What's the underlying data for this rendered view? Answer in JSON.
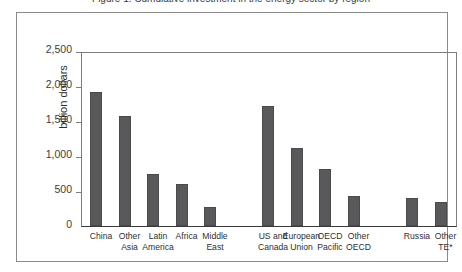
{
  "caption": {
    "text": "Figure 1. Cumulative investment in the energy sector by region"
  },
  "chart_data": {
    "type": "bar",
    "title": "",
    "xlabel": "",
    "ylabel": "billion dollars",
    "ylim": [
      0,
      2500
    ],
    "grid": false,
    "legend": "none",
    "y_ticks": [
      "0",
      "500",
      "1,000",
      "1,500",
      "2,000",
      "2,500"
    ],
    "y_tick_values": [
      0,
      500,
      1000,
      1500,
      2000,
      2500
    ],
    "categories": [
      "China",
      "Other Asia",
      "Latin America",
      "Africa",
      "Middle East",
      "US and Canada",
      "European Union",
      "OECD Pacific",
      "Other OECD",
      "Russia",
      "Other TE*"
    ],
    "category_lines": [
      [
        "China"
      ],
      [
        "Other",
        "Asia"
      ],
      [
        "Latin",
        "America"
      ],
      [
        "Africa"
      ],
      [
        "Middle",
        "East"
      ],
      [
        "US and",
        "Canada"
      ],
      [
        "European",
        "Union"
      ],
      [
        "OECD",
        "Pacific"
      ],
      [
        "Other",
        "OECD"
      ],
      [
        "Russia"
      ],
      [
        "Other",
        "TE*"
      ]
    ],
    "values": [
      1910,
      1570,
      750,
      600,
      270,
      1710,
      1110,
      820,
      430,
      400,
      340
    ],
    "groups": [
      {
        "name": "Developing",
        "indices": [
          0,
          1,
          2,
          3,
          4
        ]
      },
      {
        "name": "OECD",
        "indices": [
          5,
          6,
          7,
          8
        ]
      },
      {
        "name": "Transition economies",
        "indices": [
          9,
          10
        ]
      }
    ],
    "bar_color": "#59595b",
    "axis_color": "#3a3a3a",
    "frame_color": "#8a8a8a"
  }
}
